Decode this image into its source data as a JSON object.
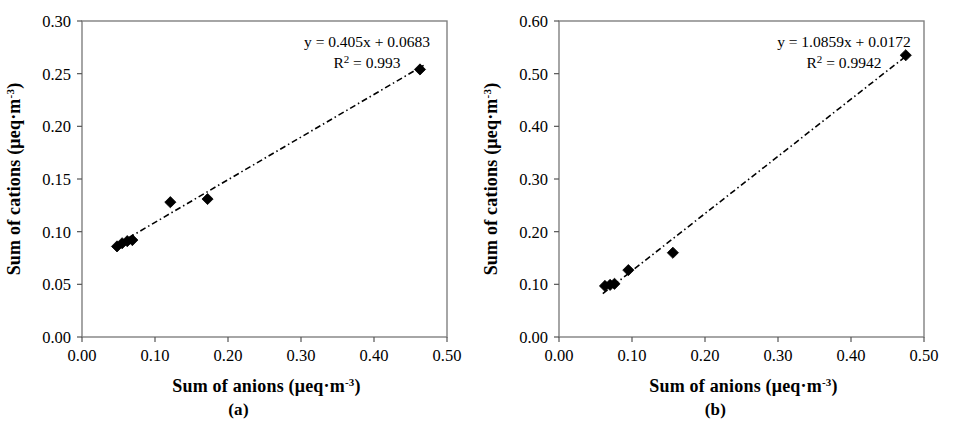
{
  "figure": {
    "panels": [
      {
        "caption": "(a)",
        "chart_data": {
          "type": "scatter",
          "title": "",
          "xlabel": "Sum of anions (μeq·m⁻³)",
          "ylabel": "Sum of cations (μeq·m⁻³)",
          "xlabel_parts": {
            "main": "Sum of anions (μeq·m",
            "sup": "-3",
            "tail": ")"
          },
          "ylabel_parts": {
            "main": "Sum of cations (μeq·m",
            "sup": "-3",
            "tail": ")"
          },
          "xlim": [
            0.0,
            0.5
          ],
          "ylim": [
            0.0,
            0.3
          ],
          "xticks": [
            0.0,
            0.1,
            0.2,
            0.3,
            0.4,
            0.5
          ],
          "yticks": [
            0.0,
            0.05,
            0.1,
            0.15,
            0.2,
            0.25,
            0.3
          ],
          "xtick_labels": [
            "0.00",
            "0.10",
            "0.20",
            "0.30",
            "0.40",
            "0.50"
          ],
          "ytick_labels": [
            "0.00",
            "0.05",
            "0.10",
            "0.15",
            "0.20",
            "0.25",
            "0.30"
          ],
          "grid": false,
          "legend": "none",
          "marker": "filled-diamond",
          "marker_color": "#000000",
          "points": [
            {
              "x": 0.048,
              "y": 0.086
            },
            {
              "x": 0.055,
              "y": 0.089
            },
            {
              "x": 0.062,
              "y": 0.091
            },
            {
              "x": 0.069,
              "y": 0.092
            },
            {
              "x": 0.121,
              "y": 0.128
            },
            {
              "x": 0.172,
              "y": 0.131
            },
            {
              "x": 0.463,
              "y": 0.254
            }
          ],
          "trendline": {
            "slope": 0.405,
            "intercept": 0.0683,
            "r2": 0.993,
            "style": "dash-dot",
            "color": "#000000",
            "x_start": 0.048,
            "x_end": 0.468
          },
          "annotations": {
            "equation": "y = 0.405x + 0.0683",
            "r2_prefix": "R",
            "r2_sup": "2",
            "r2_value": " = 0.993"
          }
        }
      },
      {
        "caption": "(b)",
        "chart_data": {
          "type": "scatter",
          "title": "",
          "xlabel": "Sum of anions (μeq·m⁻³)",
          "ylabel": "Sum of cations (μeq·m⁻³)",
          "xlabel_parts": {
            "main": "Sum of anions (μeq·m",
            "sup": "-3",
            "tail": ")"
          },
          "ylabel_parts": {
            "main": "Sum of cations (μeq·m",
            "sup": "-3",
            "tail": ")"
          },
          "xlim": [
            0.0,
            0.5
          ],
          "ylim": [
            0.0,
            0.6
          ],
          "xticks": [
            0.0,
            0.1,
            0.2,
            0.3,
            0.4,
            0.5
          ],
          "yticks": [
            0.0,
            0.1,
            0.2,
            0.3,
            0.4,
            0.5,
            0.6
          ],
          "xtick_labels": [
            "0.00",
            "0.10",
            "0.20",
            "0.30",
            "0.40",
            "0.50"
          ],
          "ytick_labels": [
            "0.00",
            "0.10",
            "0.20",
            "0.30",
            "0.40",
            "0.50",
            "0.60"
          ],
          "grid": false,
          "legend": "none",
          "marker": "filled-diamond",
          "marker_color": "#000000",
          "points": [
            {
              "x": 0.063,
              "y": 0.097
            },
            {
              "x": 0.07,
              "y": 0.099
            },
            {
              "x": 0.076,
              "y": 0.101
            },
            {
              "x": 0.095,
              "y": 0.127
            },
            {
              "x": 0.156,
              "y": 0.16
            },
            {
              "x": 0.475,
              "y": 0.535
            }
          ],
          "trendline": {
            "slope": 1.0859,
            "intercept": 0.0172,
            "r2": 0.9942,
            "style": "dash-dot",
            "color": "#000000",
            "x_start": 0.06,
            "x_end": 0.478
          },
          "annotations": {
            "equation": "y = 1.0859x + 0.0172",
            "r2_prefix": "R",
            "r2_sup": "2",
            "r2_value": " = 0.9942"
          }
        }
      }
    ]
  }
}
